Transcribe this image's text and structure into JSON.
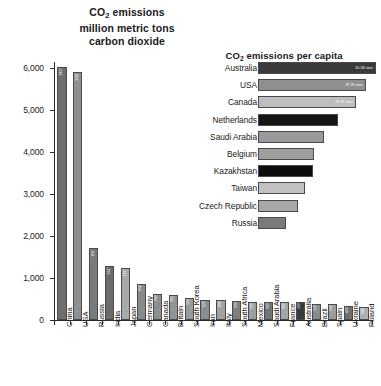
{
  "chart_data": [
    {
      "type": "bar",
      "orientation": "vertical",
      "title": "CO2 emissions million metric tons carbon dioxide",
      "title_lines": [
        "CO2 emissions",
        "million metric tons",
        "carbon dioxide"
      ],
      "xlabel": "",
      "ylabel": "",
      "ylim": [
        0,
        6000
      ],
      "yticks": [
        "0",
        "1,000",
        "2,000",
        "3,000",
        "4,000",
        "5,000",
        "6,000"
      ],
      "ytick_values": [
        0,
        1000,
        2000,
        3000,
        4000,
        5000,
        6000
      ],
      "grid": false,
      "legend": "none",
      "categories": [
        "China",
        "USA",
        "Russia",
        "India",
        "Japan",
        "Germany",
        "Canada",
        "Britain",
        "South Korea",
        "Iran",
        "Italy",
        "South Africa",
        "Mexico",
        "Saudi Arabia",
        "France",
        "Australia",
        "Brazil",
        "Spain",
        "Ukraine",
        "Poland"
      ],
      "values": [
        6018,
        5903,
        1704,
        1293,
        1247,
        858,
        614,
        586,
        515,
        471,
        468,
        444,
        436,
        424,
        418,
        417,
        377,
        372,
        329,
        303
      ],
      "value_labels": [
        "6,018",
        "5,903",
        "1,704",
        "1,293",
        "1,247",
        "858",
        "614",
        "586",
        "515",
        "471",
        "468",
        "444",
        "436",
        "424",
        "418",
        "417",
        "377",
        "372",
        "329",
        "303"
      ],
      "bar_shades": [
        "#6e6e6e",
        "#8f8f8f",
        "#7a7a7a",
        "#6b6b6b",
        "#a9a9a9",
        "#8a8a8a",
        "#8f8f8f",
        "#949494",
        "#9a9a9a",
        "#8c8c8c",
        "#a2a2a2",
        "#7e7e7e",
        "#9e9e9e",
        "#747474",
        "#a6a6a6",
        "#3a3a3a",
        "#8a8a8a",
        "#9c9c9c",
        "#6f6f6f",
        "#b0b0b0"
      ]
    },
    {
      "type": "bar",
      "orientation": "horizontal",
      "title": "CO2 emissions per capita",
      "xlabel": "",
      "ylabel": "",
      "xlim": [
        0,
        20.58
      ],
      "grid": false,
      "legend": "none",
      "categories": [
        "Australia",
        "USA",
        "Canada",
        "Netherlands",
        "Saudi Arabia",
        "Belgium",
        "Kazakhstan",
        "Taiwan",
        "Czech Republic",
        "Russia"
      ],
      "values": [
        20.58,
        19.78,
        18.81,
        17.22,
        15.78,
        13.64,
        13.29,
        11.98,
        11.33,
        11.21
      ],
      "value_labels": [
        "20.58 tons",
        "19.78 tons",
        "18.81 tons",
        "",
        "",
        "",
        "",
        "",
        "",
        ""
      ],
      "bar_shades": [
        "#3a3a3a",
        "#8f8f8f",
        "#bdbdbd",
        "#151515",
        "#9a9a9a",
        "#9e9e9e",
        "#0d0d0d",
        "#c2c2c2",
        "#a8a8a8",
        "#7a7a7a"
      ],
      "bar_lengths_px": [
        118,
        108,
        98,
        80,
        66,
        56,
        55,
        47,
        40,
        28
      ]
    }
  ],
  "units": {
    "left_axis_unit": "million metric tons",
    "right_axis_unit": "tons"
  }
}
